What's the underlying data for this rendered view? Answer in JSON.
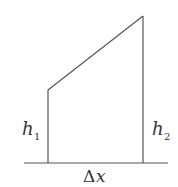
{
  "diagram": {
    "type": "trapezoid-area-element",
    "labels": {
      "left_height": {
        "base": "h",
        "sub": "1"
      },
      "right_height": {
        "base": "h",
        "sub": "2"
      },
      "width": {
        "delta": "Δ",
        "var": "x"
      }
    },
    "colors": {
      "stroke": "#555555",
      "text": "#333333",
      "background": "#ffffff"
    }
  }
}
